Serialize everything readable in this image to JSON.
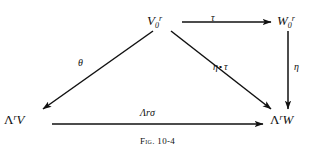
{
  "figure": {
    "caption_prefix": "Fig.",
    "caption_number": "10-4",
    "background_color": "#ffffff",
    "ink_color": "#111111"
  },
  "diagram": {
    "type": "commutative-diagram",
    "nodes": [
      {
        "id": "v0r",
        "name": "top-left-object",
        "base": "V",
        "subscript": "0",
        "superscript": "r",
        "plain": "V₀ʳ",
        "x": 160,
        "y": 20
      },
      {
        "id": "w0r",
        "name": "top-right-object",
        "base": "W",
        "subscript": "0",
        "superscript": "r",
        "plain": "W₀ʳ",
        "x": 290,
        "y": 20
      },
      {
        "id": "lambda_v",
        "name": "bottom-left-object",
        "base": "Λ",
        "superscript": "r",
        "argument": "V",
        "plain": "ΛʳV",
        "x": 18,
        "y": 119
      },
      {
        "id": "lambda_w",
        "name": "bottom-right-object",
        "base": "Λ",
        "superscript": "r",
        "argument": "W",
        "plain": "ΛʳW",
        "x": 286,
        "y": 119
      }
    ],
    "arrows": [
      {
        "id": "tau",
        "name": "arrow-v0r-to-w0r",
        "from": "v0r",
        "to": "w0r",
        "label": "τ",
        "label_position": "above",
        "x1": 182,
        "y1": 22,
        "x2": 272,
        "y2": 22
      },
      {
        "id": "theta",
        "name": "arrow-v0r-to-lambda-v",
        "from": "v0r",
        "to": "lambda_v",
        "label": "θ",
        "label_position": "left",
        "x1": 153,
        "y1": 30,
        "x2": 42,
        "y2": 110
      },
      {
        "id": "eta-compose-tau",
        "name": "arrow-v0r-to-lambda-w",
        "from": "v0r",
        "to": "lambda_w",
        "label": "η ∘ τ",
        "label_left": "η",
        "label_op": "∘",
        "label_right": "τ",
        "label_position": "right",
        "x1": 170,
        "y1": 30,
        "x2": 272,
        "y2": 110
      },
      {
        "id": "eta",
        "name": "arrow-w0r-to-lambda-w",
        "from": "w0r",
        "to": "lambda_w",
        "label": "η",
        "label_position": "right",
        "x1": 288,
        "y1": 30,
        "x2": 288,
        "y2": 110
      },
      {
        "id": "lambda-sigma",
        "name": "arrow-lambda-v-to-lambda-w",
        "from": "lambda_v",
        "to": "lambda_w",
        "label": "Λʳσ",
        "label_base": "Λ",
        "label_sup": "r",
        "label_arg": "σ",
        "label_position": "above",
        "x1": 52,
        "y1": 124,
        "x2": 264,
        "y2": 124
      }
    ]
  }
}
